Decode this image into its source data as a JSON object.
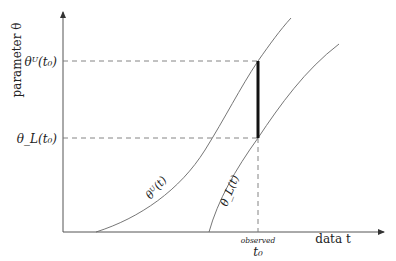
{
  "diagram": {
    "y_axis_label": "parameter θ",
    "x_axis_label": "data t",
    "x_marker_caption": "observed",
    "x_marker_label": "t₀",
    "upper_level_label": "θᵁ(t₀)",
    "lower_level_label": "θ_L(t₀)",
    "upper_curve_label": "θᵁ(t)",
    "lower_curve_label": "θ_L(t)",
    "colors": {
      "axes": "#555555",
      "curves": "#666666",
      "dashed": "#777777",
      "interval_bar": "#111111"
    }
  }
}
